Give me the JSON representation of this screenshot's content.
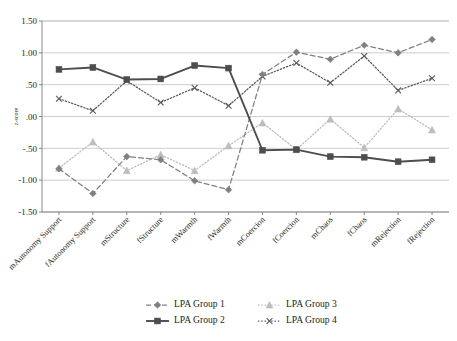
{
  "chart_data": {
    "type": "line",
    "title": "",
    "xlabel": "",
    "ylabel": "z-score",
    "ylim": [
      -1.5,
      1.5
    ],
    "yticks": [
      "1.50",
      "1.00",
      ".50",
      ".00",
      "-.50",
      "-1.00",
      "-1.50"
    ],
    "ytick_values": [
      1.5,
      1.0,
      0.5,
      0.0,
      -0.5,
      -1.0,
      -1.5
    ],
    "grid": true,
    "legend_position": "bottom",
    "categories": [
      "mAutonomy Support",
      "fAutonomy Support",
      "mStructure",
      "fStructure",
      "mWarmth",
      "fWarmth",
      "mCoercion",
      "fCoercion",
      "mChaos",
      "fChaos",
      "mRejection",
      "fRejection"
    ],
    "series": [
      {
        "name": "LPA Group 1",
        "marker": "diamond",
        "linestyle": "dashed",
        "color": "#808080",
        "values": [
          -0.82,
          -1.21,
          -0.63,
          -0.68,
          -1.01,
          -1.15,
          0.66,
          1.01,
          0.9,
          1.12,
          1.0,
          1.21
        ]
      },
      {
        "name": "LPA Group 2",
        "marker": "square",
        "linestyle": "solid",
        "color": "#4d4d4d",
        "values": [
          0.74,
          0.77,
          0.58,
          0.59,
          0.8,
          0.76,
          -0.53,
          -0.52,
          -0.63,
          -0.64,
          -0.71,
          -0.68
        ]
      },
      {
        "name": "LPA Group 3",
        "marker": "triangle",
        "linestyle": "dotted",
        "color": "#bdbdbd",
        "values": [
          -0.81,
          -0.4,
          -0.85,
          -0.6,
          -0.85,
          -0.46,
          -0.1,
          -0.52,
          -0.04,
          -0.49,
          0.12,
          -0.21
        ]
      },
      {
        "name": "LPA Group 4",
        "marker": "cross",
        "linestyle": "dotted",
        "color": "#595959",
        "values": [
          0.28,
          0.09,
          0.56,
          0.22,
          0.45,
          0.17,
          0.63,
          0.84,
          0.53,
          0.95,
          0.41,
          0.6
        ]
      }
    ]
  },
  "legend": {
    "entries": [
      {
        "label": "LPA Group 1"
      },
      {
        "label": "LPA Group 2"
      },
      {
        "label": "LPA Group 3"
      },
      {
        "label": "LPA Group 4"
      }
    ]
  }
}
